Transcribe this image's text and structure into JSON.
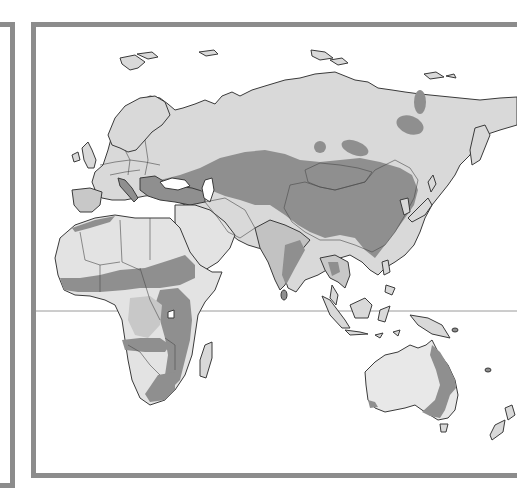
{
  "map": {
    "title": "",
    "region": "Eastern Hemisphere",
    "palette": {
      "frame": "#8c8c8c",
      "background": "#ffffff",
      "land_light": "#d9d9d9",
      "land_lightest": "#ececec",
      "land_medium": "#c2c2c2",
      "land_dark": "#8f8f8f",
      "outline": "#3a3a3a",
      "equator": "#9a9a9a"
    },
    "features": [
      {
        "name": "equator-line",
        "type": "line"
      },
      {
        "name": "europe",
        "shading": "mixed"
      },
      {
        "name": "russia-siberia",
        "shading": "light"
      },
      {
        "name": "central-asia-china-belt",
        "shading": "dark"
      },
      {
        "name": "africa",
        "shading": "mixed"
      },
      {
        "name": "india",
        "shading": "mixed"
      },
      {
        "name": "southeast-asia",
        "shading": "mixed"
      },
      {
        "name": "japan",
        "shading": "light"
      },
      {
        "name": "indonesia",
        "shading": "light"
      },
      {
        "name": "australia",
        "shading": "mixed"
      },
      {
        "name": "madagascar",
        "shading": "light"
      },
      {
        "name": "new-zealand",
        "shading": "light"
      }
    ]
  }
}
